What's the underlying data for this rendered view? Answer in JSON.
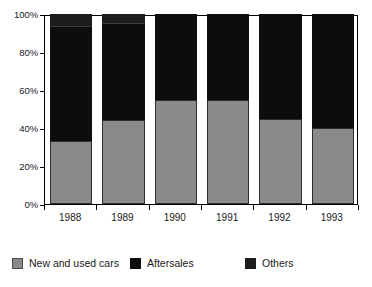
{
  "chart_data": {
    "type": "bar",
    "subtype": "stacked-percentage",
    "title": "",
    "xlabel": "",
    "ylabel": "",
    "categories": [
      "1988",
      "1989",
      "1990",
      "1991",
      "1992",
      "1993"
    ],
    "ylim": [
      0,
      100
    ],
    "y_tick_labels": [
      "0%",
      "20%",
      "40%",
      "60%",
      "80%",
      "100%"
    ],
    "y_tick_values": [
      0,
      20,
      40,
      60,
      80,
      100
    ],
    "grid": false,
    "legend_position": "bottom",
    "series": [
      {
        "name": "New and used cars",
        "color": "#8a8a8a",
        "values": [
          33,
          44,
          55,
          55,
          45,
          40
        ]
      },
      {
        "name": "Aftersales",
        "color": "#0d0d0d",
        "values": [
          60,
          51,
          45,
          45,
          55,
          60
        ]
      },
      {
        "name": "Others",
        "color": "#1c1c1c",
        "values": [
          7,
          5,
          0,
          0,
          0,
          0
        ]
      }
    ]
  },
  "legend": {
    "items": [
      {
        "label": "New and used cars",
        "swatch": "legend-swatch-new-and-used-cars"
      },
      {
        "label": "Aftersales",
        "swatch": "legend-swatch-aftersales"
      },
      {
        "label": "Others",
        "swatch": "legend-swatch-others"
      }
    ]
  }
}
